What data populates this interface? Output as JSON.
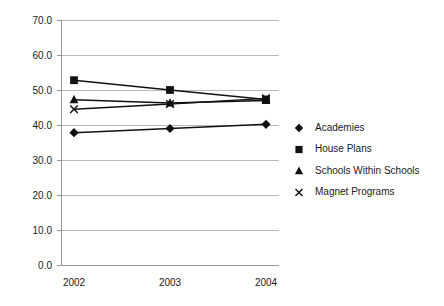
{
  "chart_data": {
    "type": "line",
    "title": "",
    "xlabel": "",
    "ylabel": "",
    "x": [
      "2002",
      "2003",
      "2004"
    ],
    "categories": [
      "2002",
      "2003",
      "2004"
    ],
    "ylim": [
      0,
      70
    ],
    "ytick_values": [
      0,
      10,
      20,
      30,
      40,
      50,
      60,
      70
    ],
    "ytick_labels": [
      "0.0",
      "10.0",
      "20.0",
      "30.0",
      "40.0",
      "50.0",
      "60.0",
      "70.0"
    ],
    "grid": true,
    "legend_position": "right",
    "series": [
      {
        "name": "Academies",
        "marker": "diamond",
        "values": [
          37.8,
          39.0,
          40.2
        ]
      },
      {
        "name": "House Plans",
        "marker": "square",
        "values": [
          52.8,
          50.0,
          47.3
        ]
      },
      {
        "name": "Schools Within Schools",
        "marker": "triangle",
        "values": [
          47.2,
          46.3,
          47.0
        ]
      },
      {
        "name": "Magnet Programs",
        "marker": "x",
        "values": [
          44.5,
          46.0,
          47.6
        ]
      }
    ]
  },
  "legend": {
    "items": [
      {
        "label": "Academies",
        "marker": "diamond-marker-icon"
      },
      {
        "label": "House Plans",
        "marker": "square-marker-icon"
      },
      {
        "label": "Schools Within Schools",
        "marker": "triangle-marker-icon"
      },
      {
        "label": "Magnet Programs",
        "marker": "x-marker-icon"
      }
    ]
  },
  "colors": {
    "series": "#111111",
    "grid": "#a9a9a9",
    "axis": "#8c8c8c",
    "background": "#ffffff",
    "text": "#1a1a1a"
  }
}
